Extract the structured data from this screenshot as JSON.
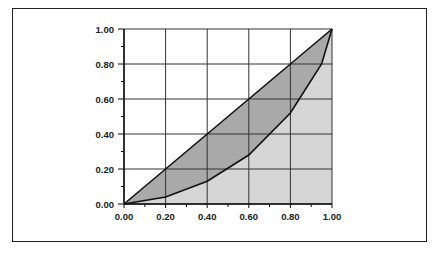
{
  "chart_data": {
    "type": "area",
    "title": "",
    "xlabel": "",
    "ylabel": "",
    "xlim": [
      0,
      1
    ],
    "ylim": [
      0,
      1
    ],
    "grid": true,
    "x_ticks": [
      "0.00",
      "0.20",
      "0.40",
      "0.60",
      "0.80",
      "1.00"
    ],
    "y_ticks": [
      "0.00",
      "0.20",
      "0.40",
      "0.60",
      "0.80",
      "1.00"
    ],
    "series": [
      {
        "name": "Line of equality",
        "x": [
          0,
          1
        ],
        "y": [
          0,
          1
        ]
      },
      {
        "name": "Lorenz curve",
        "x": [
          0,
          0.2,
          0.4,
          0.6,
          0.8,
          0.95,
          1.0
        ],
        "y": [
          0,
          0.04,
          0.13,
          0.28,
          0.52,
          0.8,
          1.0
        ]
      }
    ],
    "fills": {
      "between_curves": "#a9a9a9",
      "below_curve": "#d6d6d6"
    }
  }
}
